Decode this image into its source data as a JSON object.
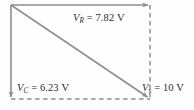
{
  "diagram": {
    "colors": {
      "solid_line": "#8e8e8e",
      "dashed_line": "#8e8e8e",
      "text": "#2b2b2b",
      "background": "#fefefe"
    },
    "labels": {
      "resistor": {
        "symbol": "V",
        "subscript": "R",
        "equals": "=",
        "value": "7.82",
        "unit": "V",
        "full": "V_R = 7.82 V"
      },
      "capacitor": {
        "symbol": "V",
        "subscript": "C",
        "equals": "=",
        "value": "6.23",
        "unit": "V",
        "full": "V_C = 6.23 V"
      },
      "source": {
        "symbol": "V",
        "subscript": "s",
        "equals": "=",
        "value": "10",
        "unit": "V",
        "full": "V_s = 10 V"
      }
    },
    "vectors": [
      {
        "name": "vr-arrow",
        "style": "solid",
        "direction": "right",
        "from": [
          11,
          5
        ],
        "to": [
          150,
          5
        ],
        "magnitude": 7.82,
        "unit": "V"
      },
      {
        "name": "vc-arrow",
        "style": "solid",
        "direction": "down",
        "from": [
          11,
          5
        ],
        "to": [
          11,
          99
        ],
        "magnitude": 6.23,
        "unit": "V"
      },
      {
        "name": "vs-arrow",
        "style": "solid",
        "direction": "down-right",
        "from": [
          11,
          5
        ],
        "to": [
          150,
          99
        ],
        "magnitude": 10,
        "unit": "V"
      },
      {
        "name": "vr-projection",
        "style": "dashed",
        "from": [
          11,
          99
        ],
        "to": [
          150,
          99
        ]
      },
      {
        "name": "vc-projection",
        "style": "dashed",
        "from": [
          150,
          5
        ],
        "to": [
          150,
          99
        ]
      }
    ]
  }
}
